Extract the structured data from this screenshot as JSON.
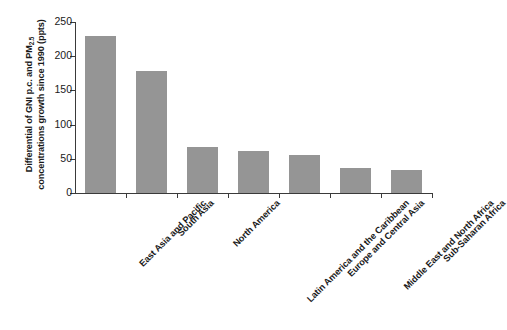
{
  "chart_data": {
    "type": "bar",
    "title": "",
    "subtitle": "",
    "xlabel": "",
    "ylabel_line1": "Differential of GNI p.c. and PM",
    "ylabel_sub": "2.5",
    "ylabel_line2": "concentrations growth since 1990 (ppts)",
    "ylabel_full": "Differential of GNI p.c. and PM2.5 concentrations growth since 1990 (ppts)",
    "categories": [
      "East Asia and Pacific",
      "South Asia",
      "North America",
      "Latin America and the Caribbean",
      "Europe and Central Asia",
      "Middle East and North Africa",
      "Sub-Saharan Africa"
    ],
    "values": [
      230,
      178,
      67,
      61,
      56,
      37,
      34
    ],
    "ylim": [
      0,
      250
    ],
    "yticks": [
      0,
      50,
      100,
      150,
      200,
      250
    ],
    "ytick_labels": [
      "0",
      "50",
      "100",
      "150",
      "200",
      "250"
    ],
    "grid": false,
    "legend": false,
    "legend_position": "none",
    "bar_color": "#959595",
    "axis_color": "#3a3a3a",
    "background_color": "#ffffff",
    "text_color": "#1a1a1a"
  }
}
